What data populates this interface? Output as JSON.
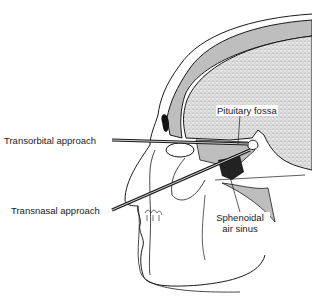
{
  "diagram": {
    "labels": {
      "pituitary_fossa": "Pituitary fossa",
      "transorbital": "Transorbital approach",
      "transnasal": "Transnasal approach",
      "sphenoidal_line1": "Sphenoidal",
      "sphenoidal_line2": "air sinus"
    },
    "colors": {
      "ink": "#1a1a1a",
      "brain_stipple": "#bdbdbd",
      "background": "#ffffff"
    }
  }
}
